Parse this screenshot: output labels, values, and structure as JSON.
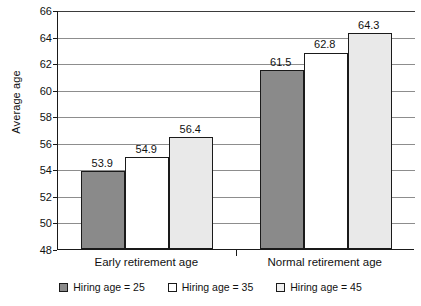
{
  "chart_data": {
    "type": "bar",
    "title": "",
    "subtitle": "",
    "xlabel": "",
    "ylabel": "Average age",
    "ylim": [
      48,
      66
    ],
    "ytick_step": 2,
    "yticks": [
      48,
      50,
      52,
      54,
      56,
      58,
      60,
      62,
      64,
      66
    ],
    "ytick_labels": [
      "48",
      "50",
      "52",
      "54",
      "56",
      "58",
      "60",
      "62",
      "64",
      "66"
    ],
    "grid": "horizontal",
    "legend_position": "bottom-center",
    "categories": [
      "Early retirement age",
      "Normal retirement age"
    ],
    "series": [
      {
        "name": "Hiring age = 25",
        "color": "#8a8a8a",
        "values": [
          53.9,
          54.9
        ],
        "value_labels": [
          "53.9",
          "54.9"
        ]
      },
      {
        "name": "Hiring age = 35",
        "color": "#ffffff",
        "values": [
          54.9,
          62.8
        ],
        "value_labels": [
          "54.9",
          "62.8"
        ]
      },
      {
        "name": "Hiring age = 45",
        "color": "#e9e9e9",
        "values": [
          56.4,
          64.3
        ],
        "value_labels": [
          "56.4",
          "64.3"
        ]
      }
    ],
    "bars": [
      {
        "category": "Early retirement age",
        "series": "Hiring age = 25",
        "value": 53.9,
        "label": "53.9",
        "series_index": 0
      },
      {
        "category": "Early retirement age",
        "series": "Hiring age = 35",
        "value": 54.9,
        "label": "54.9",
        "series_index": 1
      },
      {
        "category": "Early retirement age",
        "series": "Hiring age = 45",
        "value": 56.4,
        "label": "56.4",
        "series_index": 2
      },
      {
        "category": "Normal retirement age",
        "series": "Hiring age = 25",
        "value": 61.5,
        "label": "61.5",
        "series_index": 0
      },
      {
        "category": "Normal retirement age",
        "series": "Hiring age = 35",
        "value": 62.8,
        "label": "62.8",
        "series_index": 1
      },
      {
        "category": "Normal retirement age",
        "series": "Hiring age = 45",
        "value": 64.3,
        "label": "64.3",
        "series_index": 2
      }
    ]
  },
  "legend": {
    "items": [
      {
        "label": "Hiring age = 25",
        "swatch": "legend-swatch-dark-gray"
      },
      {
        "label": "Hiring age = 35",
        "swatch": "legend-swatch-white"
      },
      {
        "label": "Hiring age = 45",
        "swatch": "legend-swatch-light-gray"
      }
    ]
  }
}
